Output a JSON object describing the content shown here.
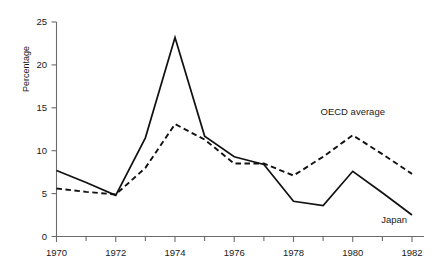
{
  "chart_data": {
    "type": "line",
    "title": "",
    "subtitle": "",
    "xlabel": "",
    "ylabel": "Percentage",
    "x": [
      1970,
      1971,
      1972,
      1973,
      1974,
      1975,
      1976,
      1977,
      1978,
      1979,
      1980,
      1981,
      1982
    ],
    "xlim": [
      1970,
      1982
    ],
    "ylim": [
      0,
      25
    ],
    "ytick_labels": [
      "0",
      "5",
      "10",
      "15",
      "20",
      "25"
    ],
    "ytick_values": [
      0,
      5,
      10,
      15,
      20,
      25
    ],
    "xtick_labels": [
      "1970",
      "1972",
      "1974",
      "1976",
      "1978",
      "1980",
      "1982"
    ],
    "xtick_values": [
      1970,
      1972,
      1974,
      1976,
      1978,
      1980,
      1982
    ],
    "xminor_tick_values": [
      1971,
      1973,
      1975,
      1977,
      1979,
      1981
    ],
    "grid": false,
    "legend_position": "inline-annotation",
    "series": [
      {
        "name": "Japan",
        "style": "solid",
        "color": "#111111",
        "values": [
          7.7,
          6.3,
          4.8,
          11.5,
          23.2,
          11.7,
          9.3,
          8.4,
          4.1,
          3.6,
          7.6,
          5.1,
          2.5
        ]
      },
      {
        "name": "OECD average",
        "style": "dashed",
        "color": "#111111",
        "values": [
          5.6,
          5.2,
          4.9,
          8.0,
          13.1,
          11.3,
          8.5,
          8.5,
          7.1,
          9.3,
          11.8,
          9.6,
          7.3
        ]
      }
    ],
    "annotations": [
      {
        "text": "OECD average",
        "x": 1980,
        "y": 14.2
      },
      {
        "text": "Japan",
        "x": 1981.4,
        "y": 1.6
      }
    ]
  },
  "axes": {
    "y_axis_title": "Percentage"
  }
}
